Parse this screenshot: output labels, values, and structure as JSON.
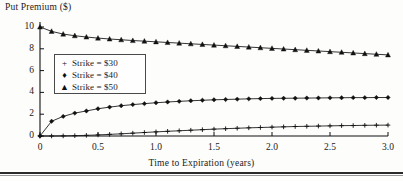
{
  "figure": {
    "background_color": "#fdfdfc",
    "line_color": "#111111"
  },
  "chart_data": {
    "type": "line",
    "title": "",
    "ylabel": "Put Premium ($)",
    "xlabel": "Time to Expiration (years)",
    "xlim": [
      0,
      3.0
    ],
    "ylim": [
      0,
      10
    ],
    "grid": false,
    "legend_position": "upper-left-inside",
    "xticks": [
      "0",
      "0.5",
      "1.0",
      "1.5",
      "2.0",
      "2.5",
      "3.0"
    ],
    "xtick_values": [
      0,
      0.5,
      1.0,
      1.5,
      2.0,
      2.5,
      3.0
    ],
    "yticks": [
      "0",
      "2",
      "4",
      "6",
      "8",
      "10"
    ],
    "ytick_values": [
      0,
      2,
      4,
      6,
      8,
      10
    ],
    "x": [
      0,
      0.1,
      0.2,
      0.3,
      0.4,
      0.5,
      0.6,
      0.7,
      0.8,
      0.9,
      1.0,
      1.1,
      1.2,
      1.3,
      1.4,
      1.5,
      1.6,
      1.7,
      1.8,
      1.9,
      2.0,
      2.1,
      2.2,
      2.3,
      2.4,
      2.5,
      2.6,
      2.7,
      2.8,
      2.9,
      3.0
    ],
    "series": [
      {
        "name": "Strike = $30",
        "marker": "plus",
        "marker_glyph": "+",
        "values": [
          0.0,
          0.0,
          0.01,
          0.03,
          0.06,
          0.1,
          0.15,
          0.2,
          0.26,
          0.32,
          0.38,
          0.43,
          0.48,
          0.53,
          0.58,
          0.63,
          0.67,
          0.71,
          0.75,
          0.78,
          0.81,
          0.84,
          0.87,
          0.89,
          0.91,
          0.93,
          0.95,
          0.96,
          0.98,
          0.99,
          1.0
        ]
      },
      {
        "name": "Strike = $40",
        "marker": "diamond",
        "marker_glyph": "♦",
        "values": [
          0.0,
          1.35,
          1.8,
          2.1,
          2.3,
          2.5,
          2.65,
          2.78,
          2.88,
          2.97,
          3.05,
          3.12,
          3.18,
          3.23,
          3.28,
          3.32,
          3.35,
          3.38,
          3.41,
          3.43,
          3.45,
          3.46,
          3.47,
          3.48,
          3.49,
          3.5,
          3.51,
          3.52,
          3.52,
          3.53,
          3.53
        ]
      },
      {
        "name": "Strike = $50",
        "marker": "triangle",
        "marker_glyph": "▲",
        "values": [
          10.0,
          9.6,
          9.35,
          9.2,
          9.08,
          8.98,
          8.9,
          8.83,
          8.76,
          8.7,
          8.64,
          8.58,
          8.52,
          8.46,
          8.4,
          8.34,
          8.28,
          8.22,
          8.16,
          8.1,
          8.04,
          7.98,
          7.92,
          7.86,
          7.8,
          7.74,
          7.68,
          7.62,
          7.56,
          7.5,
          7.44
        ]
      }
    ]
  },
  "legend": {
    "entries": [
      {
        "marker": "+",
        "label": "Strike = $30"
      },
      {
        "marker": "♦",
        "label": "Strike = $40"
      },
      {
        "marker": "▲",
        "label": "Strike = $50"
      }
    ]
  }
}
